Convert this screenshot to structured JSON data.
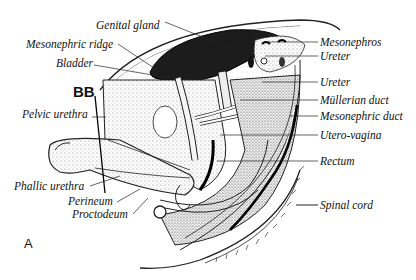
{
  "figure": {
    "panel_letter": "A",
    "marker_label": "BB",
    "labels_left": {
      "genital_gland": "Genital gland",
      "mesonephric_ridge": "Mesonephric ridge",
      "bladder": "Bladder",
      "pelvic_urethra": "Pelvic urethra",
      "phallic_urethra": "Phallic urethra",
      "perineum": "Perineum",
      "proctodeum": "Proctodeum"
    },
    "labels_right": {
      "mesonephros": "Mesonephros",
      "ureter_upper": "Ureter",
      "ureter_lower": "Ureter",
      "mullerian_duct": "Müllerian duct",
      "mesonephric_duct": "Mesonephric duct",
      "utero_vagina": "Utero-vagina",
      "rectum": "Rectum",
      "spinal_cord": "Spinal cord"
    }
  }
}
